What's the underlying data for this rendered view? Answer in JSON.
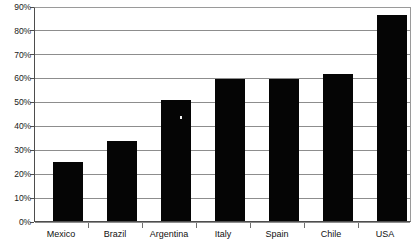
{
  "chart_data": {
    "type": "bar",
    "title": "",
    "subtitle": "",
    "xlabel": "",
    "ylabel": "",
    "categories": [
      "Mexico",
      "Brazil",
      "Argentina",
      "Italy",
      "Spain",
      "Chile",
      "USA"
    ],
    "values": [
      25,
      34,
      51,
      60,
      60,
      62,
      87
    ],
    "ylim": [
      0,
      90
    ],
    "ytick_values": [
      0,
      10,
      20,
      30,
      40,
      50,
      60,
      70,
      80,
      90
    ],
    "ytick_labels": [
      "0%",
      "10%",
      "20%",
      "30%",
      "40%",
      "50%",
      "60%",
      "70%",
      "80%",
      "90%"
    ],
    "grid": true,
    "grid_axis": "y",
    "legend": false,
    "legend_position": "none",
    "annotations": [],
    "series": [
      {
        "name": "",
        "values": [
          25,
          34,
          51,
          60,
          60,
          62,
          87
        ]
      }
    ]
  },
  "style": {
    "bar_color": "#050505",
    "grid_color": "#8d8d8d",
    "axis_color": "#4d4d4d",
    "frame_color": "#9a9a9a",
    "text_color": "#111111",
    "background": "#ffffff"
  }
}
